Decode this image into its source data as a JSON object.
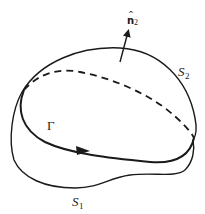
{
  "figure": {
    "labels": {
      "normal_vector": "n",
      "normal_hat": "^",
      "normal_subscript": "2",
      "surface_top": "S",
      "surface_top_subscript": "2",
      "surface_bottom": "S",
      "surface_bottom_subscript": "1",
      "boundary_curve": "Γ"
    },
    "colors": {
      "stroke": "#1a1a1a",
      "background": "#ffffff"
    }
  }
}
